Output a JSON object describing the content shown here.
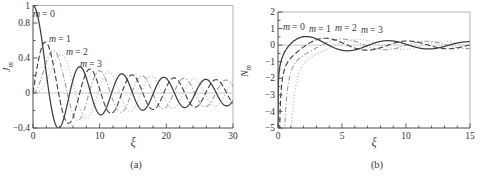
{
  "figure": {
    "background": "#ffffff"
  },
  "chart_data": [
    {
      "id": "a",
      "type": "line",
      "caption": "(a)",
      "xlabel": "ξ",
      "ylabel": {
        "base": "J",
        "sub": "m"
      },
      "xlim": [
        0,
        30
      ],
      "ylim": [
        -0.4,
        1.0
      ],
      "x_ticks_major": [
        0,
        10,
        20,
        30
      ],
      "x_tick_labels": [
        "0",
        "10",
        "20",
        "30"
      ],
      "x_ticks_minor": [
        2,
        4,
        6,
        8,
        12,
        14,
        16,
        18,
        22,
        24,
        26,
        28
      ],
      "y_ticks_major": [
        -0.4,
        0,
        0.4,
        0.8,
        1
      ],
      "y_tick_labels": [
        "−0.4",
        "0",
        "0.4",
        "0.8",
        "1"
      ],
      "y_ticks_minor": [
        -0.2,
        0.2,
        0.6
      ],
      "zero_line": true,
      "grid": false,
      "legend_position": "inline-upper-left",
      "plot_box_px": {
        "left": 33,
        "top": 5.5,
        "right": 233,
        "bottom": 128
      },
      "samples": {
        "x_start": 0,
        "x_end": 30,
        "n": 601
      },
      "function_family": "bessel_J",
      "series": [
        {
          "label": "m = 0",
          "order": 0,
          "line_style": "solid",
          "color": "#3c3c3c",
          "key_points": [
            [
              0,
              1
            ],
            [
              2.405,
              0
            ],
            [
              3.832,
              -0.403
            ],
            [
              5.52,
              0
            ],
            [
              7.016,
              0.3
            ],
            [
              8.654,
              0
            ],
            [
              10.173,
              -0.25
            ],
            [
              13.324,
              0.218
            ],
            [
              30,
              -0.086
            ]
          ]
        },
        {
          "label": "m = 1",
          "order": 1,
          "line_style": "dashed",
          "color": "#454545",
          "key_points": [
            [
              0,
              0
            ],
            [
              1.841,
              0.582
            ],
            [
              3.832,
              0
            ],
            [
              5.331,
              -0.346
            ],
            [
              7.016,
              0
            ],
            [
              8.536,
              0.273
            ],
            [
              30,
              -0.118
            ]
          ]
        },
        {
          "label": "m = 2",
          "order": 2,
          "line_style": "dashdot",
          "color": "#9c9c9c",
          "key_points": [
            [
              0,
              0
            ],
            [
              3.054,
              0.486
            ],
            [
              5.136,
              0
            ],
            [
              6.706,
              -0.313
            ],
            [
              8.417,
              0
            ],
            [
              9.969,
              0.255
            ]
          ]
        },
        {
          "label": "m = 3",
          "order": 3,
          "line_style": "dotted",
          "color": "#c0c0c0",
          "key_points": [
            [
              0,
              0
            ],
            [
              4.201,
              0.434
            ],
            [
              6.38,
              0
            ],
            [
              8.015,
              -0.291
            ],
            [
              9.761,
              0
            ],
            [
              11.346,
              0.243
            ]
          ]
        }
      ],
      "series_label_positions_px": [
        [
          44,
          17
        ],
        [
          60,
          42
        ],
        [
          77,
          55
        ],
        [
          91,
          67
        ]
      ]
    },
    {
      "id": "b",
      "type": "line",
      "caption": "(b)",
      "xlabel": "ξ",
      "ylabel": {
        "base": "N",
        "sub": "m"
      },
      "xlim": [
        0,
        15
      ],
      "ylim": [
        -5,
        2
      ],
      "x_ticks_major": [
        0,
        5,
        10,
        15
      ],
      "x_tick_labels": [
        "0",
        "5",
        "10",
        "15"
      ],
      "x_ticks_minor": [
        1,
        2,
        3,
        4,
        6,
        7,
        8,
        9,
        11,
        12,
        13,
        14
      ],
      "y_ticks_major": [
        -5,
        -4,
        -3,
        -2,
        -1,
        0,
        1,
        2
      ],
      "y_tick_labels": [
        "−5",
        "−4",
        "−3",
        "−2",
        "−1",
        "0",
        "1",
        "2"
      ],
      "y_ticks_minor": [
        -4.5,
        -3.5,
        -2.5,
        -1.5,
        -0.5,
        0.5,
        1.5
      ],
      "zero_line": true,
      "grid": false,
      "legend_position": "inline-top-row",
      "plot_box_px": {
        "left": 278,
        "top": 12,
        "right": 470,
        "bottom": 128
      },
      "samples": {
        "x_start": 0.0005,
        "x_end": 15,
        "n": 601
      },
      "function_family": "bessel_N",
      "series": [
        {
          "label": "m = 0",
          "order": 0,
          "line_style": "solid",
          "color": "#3c3c3c",
          "key_points": [
            [
              0.894,
              0
            ],
            [
              2.197,
              0.521
            ],
            [
              3.958,
              0
            ],
            [
              5.429,
              -0.34
            ],
            [
              7.086,
              0
            ],
            [
              8.596,
              0.274
            ],
            [
              15,
              0.206
            ]
          ]
        },
        {
          "label": "m = 1",
          "order": 1,
          "line_style": "dashed",
          "color": "#454545",
          "key_points": [
            [
              2.197,
              0
            ],
            [
              3.683,
              0.417
            ],
            [
              5.43,
              0
            ],
            [
              7.015,
              -0.303
            ],
            [
              8.596,
              0
            ],
            [
              10.235,
              0.249
            ],
            [
              15,
              0.021
            ]
          ]
        },
        {
          "label": "m = 2",
          "order": 2,
          "line_style": "dashdot",
          "color": "#9c9c9c",
          "key_points": [
            [
              3.384,
              0
            ],
            [
              5.003,
              0.367
            ],
            [
              6.794,
              0
            ],
            [
              8.351,
              -0.28
            ],
            [
              10.023,
              0
            ],
            [
              15,
              -0.203
            ]
          ]
        },
        {
          "label": "m = 3",
          "order": 3,
          "line_style": "dotted",
          "color": "#c0c0c0",
          "key_points": [
            [
              4.527,
              0
            ],
            [
              6.216,
              0.333
            ],
            [
              8.098,
              0
            ],
            [
              9.617,
              -0.265
            ],
            [
              15,
              -0.075
            ]
          ]
        }
      ],
      "series_label_positions_px": [
        [
          294,
          30
        ],
        [
          320,
          32
        ],
        [
          346,
          31
        ],
        [
          372,
          33
        ]
      ]
    }
  ],
  "style_colors": {
    "frame_dark": "#4b4b4b",
    "frame_light": "#adadad",
    "zero_line": "#c2c2c2",
    "tick": "#4b4b4b",
    "text": "#333333"
  }
}
